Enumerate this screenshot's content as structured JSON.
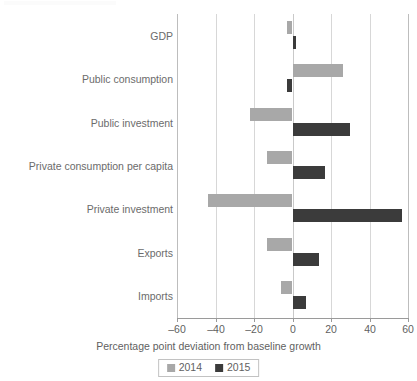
{
  "chart_data": {
    "type": "bar",
    "orientation": "horizontal",
    "title": "",
    "subtitle": "",
    "xlabel": "Percentage point deviation from baseline growth",
    "ylabel": "",
    "xlim": [
      -60,
      60
    ],
    "xticks": [
      -60,
      -40,
      -20,
      0,
      20,
      40,
      60
    ],
    "xtick_labels": [
      "–60",
      "–40",
      "–20",
      "0",
      "20",
      "40",
      "60"
    ],
    "grid": true,
    "grid_axis": "x",
    "legend_position": "bottom",
    "categories": [
      "GDP",
      "Public consumption",
      "Public investment",
      "Private consumption per capita",
      "Private investment",
      "Exports",
      "Imports"
    ],
    "series": [
      {
        "name": "2014",
        "color": "#a8a8a8",
        "values": [
          -3,
          26,
          -22,
          -13,
          -44,
          -13,
          -6
        ]
      },
      {
        "name": "2015",
        "color": "#3b3b3b",
        "values": [
          2,
          -3,
          30,
          17,
          57,
          14,
          7
        ]
      }
    ]
  },
  "legend": {
    "items": [
      {
        "label": "2014",
        "color": "#a8a8a8"
      },
      {
        "label": "2015",
        "color": "#3b3b3b"
      }
    ]
  },
  "axis": {
    "x_title": "Percentage point deviation from baseline growth"
  },
  "colors": {
    "series_2014": "#a8a8a8",
    "series_2015": "#3b3b3b",
    "gridline": "#d7d7d7",
    "axis": "#9a9a9a",
    "text": "#5f5f5f",
    "background": "#ffffff"
  }
}
